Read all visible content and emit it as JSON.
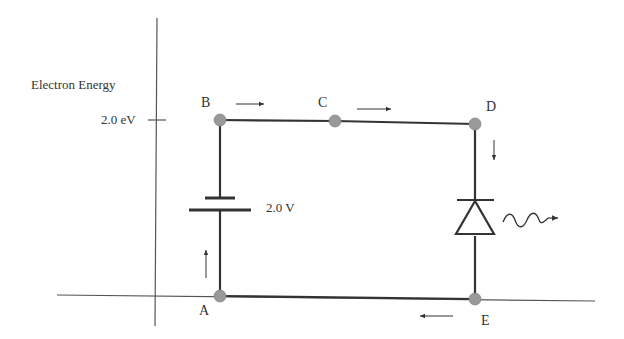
{
  "axis": {
    "y_label": "Electron Energy",
    "tick_label": "2.0 eV"
  },
  "nodes": {
    "A": "A",
    "B": "B",
    "C": "C",
    "D": "D",
    "E": "E"
  },
  "battery": {
    "label": "2.0 V"
  },
  "colors": {
    "wire": "#333333",
    "node": "#999999",
    "axis": "#444444"
  }
}
